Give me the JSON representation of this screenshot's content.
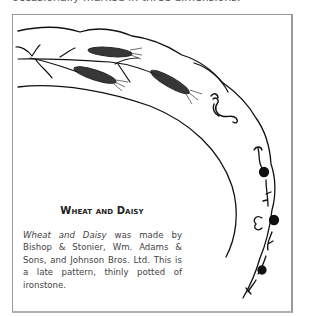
{
  "page": {
    "top_text": "occasionally marked in three dimensions."
  },
  "figure": {
    "illustration": "plate-rim-wheat-and-daisy-drawing",
    "heading": "Wheat and Daisy",
    "caption_italic": "Wheat and Daisy",
    "caption_rest": " was made by Bishop & Stonier, Wm. Adams & Sons, and Johnson Bros. Ltd. This is a late pattern, thinly potted of ironstone."
  }
}
